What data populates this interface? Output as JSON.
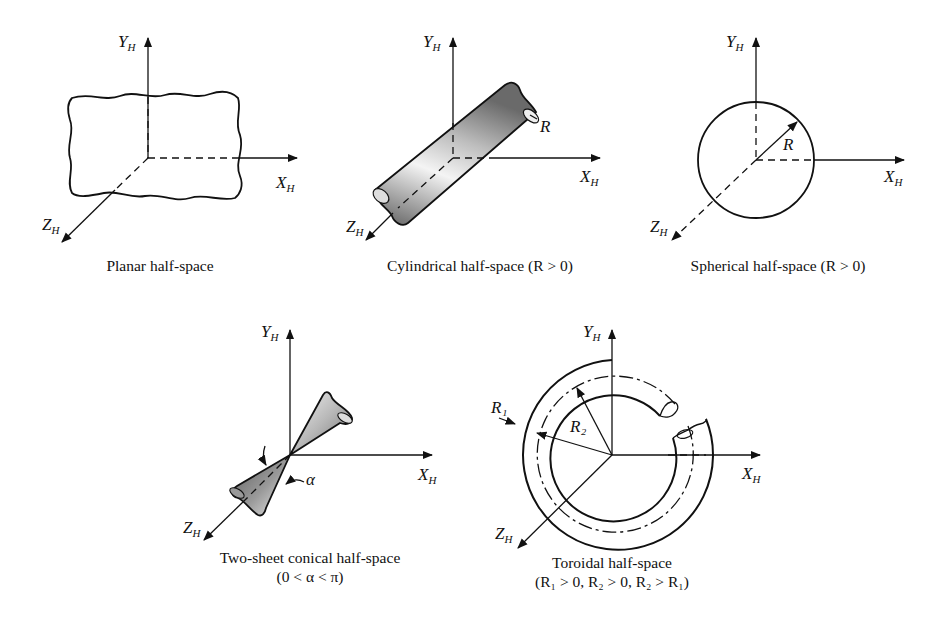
{
  "axes": {
    "x": "X",
    "y": "Y",
    "z": "Z",
    "subscript": "H"
  },
  "panels": [
    {
      "id": "planar",
      "caption": "Planar half-space",
      "caption2": ""
    },
    {
      "id": "cylindrical",
      "caption": "Cylindrical half-space (R > 0)",
      "caption2": "",
      "param_label": "R"
    },
    {
      "id": "spherical",
      "caption": "Spherical half-space (R > 0)",
      "caption2": "",
      "param_label": "R"
    },
    {
      "id": "conical",
      "caption": "Two-sheet conical half-space",
      "caption2": "(0 < α < π)",
      "param_label": "α"
    },
    {
      "id": "toroidal",
      "caption": "Toroidal half-space",
      "caption2": "(R₁ > 0, R₂ > 0, R₂ > R₁)",
      "param_label_1": "R₁",
      "param_label_2": "R₂"
    }
  ],
  "colors": {
    "line": "#111111",
    "background": "#ffffff",
    "shade_dark": "#6e6e6e",
    "shade_light": "#f2f2f2"
  }
}
